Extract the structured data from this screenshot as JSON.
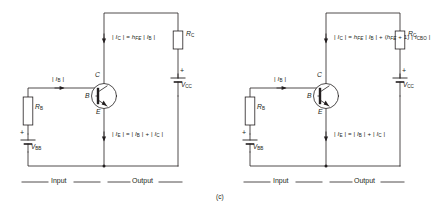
{
  "figure": {
    "caption": "(c)",
    "domain_kind": "transistor-bias-circuit-pair"
  },
  "circuits": [
    {
      "id": "left",
      "name": "ideal-common-emitter",
      "transistor": {
        "type": "npn",
        "collector_label": "C",
        "base_label": "B",
        "emitter_label": "E"
      },
      "components": {
        "base_resistor": "R",
        "base_resistor_sub": "B",
        "collector_resistor": "R",
        "collector_resistor_sub": "C",
        "base_supply": "V",
        "base_supply_sub": "BB",
        "collector_supply": "V",
        "collector_supply_sub": "CC",
        "base_supply_polarity": "+",
        "collector_supply_polarity": "+"
      },
      "labels": {
        "base_current": "| I B |",
        "collector_equation": "| I C |  =  h FE | I B |",
        "emitter_equation": "| I E |  =  | I B |  +  | I C |"
      },
      "sections": {
        "input": "Input",
        "output": "Output"
      }
    },
    {
      "id": "right",
      "name": "common-emitter-with-leakage",
      "transistor": {
        "type": "npn",
        "collector_label": "C",
        "base_label": "B",
        "emitter_label": "E"
      },
      "components": {
        "base_resistor": "R",
        "base_resistor_sub": "B",
        "collector_resistor": "R",
        "collector_resistor_sub": "C",
        "base_supply": "V",
        "base_supply_sub": "BB",
        "collector_supply": "V",
        "collector_supply_sub": "CC",
        "base_supply_polarity": "+",
        "collector_supply_polarity": "+"
      },
      "labels": {
        "base_current": "| I B |",
        "collector_equation": "| I C |  =  h FE | I B |  +  ( h FE + 1 ) | I CBO |",
        "emitter_equation": "| I E |  =  | I B |  +  | I C |"
      },
      "sections": {
        "input": "Input",
        "output": "Output"
      }
    }
  ],
  "colors": {
    "line": "#231f20",
    "text": "#231f20",
    "background": "#ffffff"
  }
}
